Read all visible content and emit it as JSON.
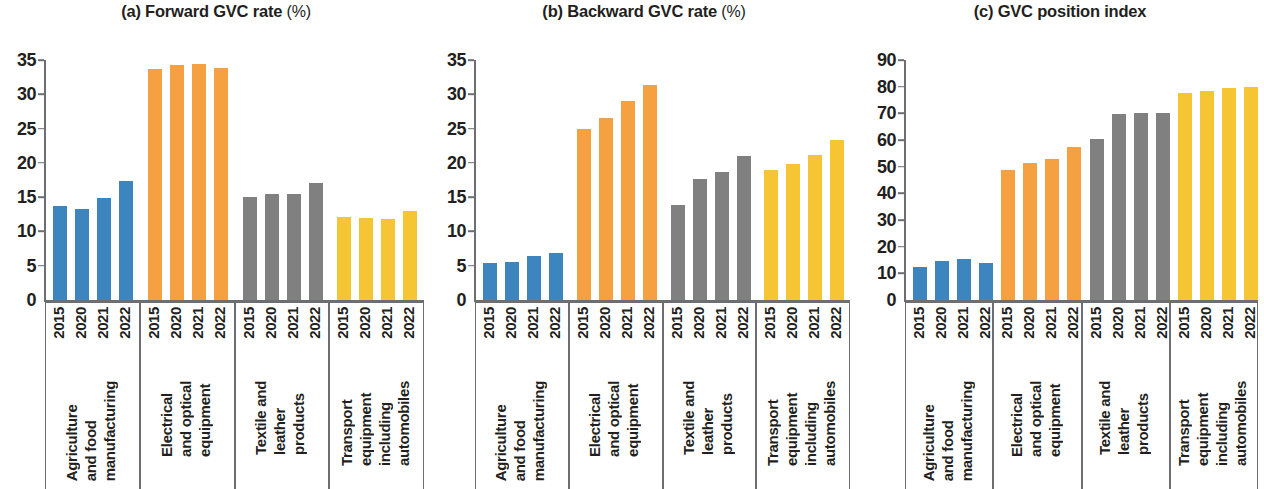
{
  "chart_data": [
    {
      "type": "bar",
      "panel": "(a)",
      "title": "(a) Forward GVC rate",
      "title_main": "(a) Forward GVC rate",
      "title_unit": "(%)",
      "xlabel": "",
      "ylabel": "",
      "ylim": [
        0,
        35
      ],
      "yticks": [
        0,
        5,
        10,
        15,
        20,
        25,
        30,
        35
      ],
      "grid": false,
      "legend": "none",
      "categories": [
        "Agriculture and food manufacturing",
        "Electrical and optical equipment",
        "Textile and leather products",
        "Transport equipment including automobiles"
      ],
      "x": [
        "2015",
        "2020",
        "2021",
        "2022"
      ],
      "series": [
        {
          "name": "Agriculture and food manufacturing",
          "color": "#3d85bf",
          "values": [
            13.7,
            13.3,
            14.9,
            17.3
          ]
        },
        {
          "name": "Electrical and optical equipment",
          "color": "#f5a142",
          "values": [
            33.7,
            34.3,
            34.4,
            33.8
          ]
        },
        {
          "name": "Textile and leather products",
          "color": "#808080",
          "values": [
            15.0,
            15.4,
            15.4,
            17.1
          ]
        },
        {
          "name": "Transport equipment including automobiles",
          "color": "#f6c533",
          "values": [
            12.1,
            11.9,
            11.8,
            13.0
          ]
        }
      ]
    },
    {
      "type": "bar",
      "panel": "(b)",
      "title": "(b) Backward GVC rate",
      "title_main": "(b) Backward GVC rate",
      "title_unit": "(%)",
      "xlabel": "",
      "ylabel": "",
      "ylim": [
        0,
        35
      ],
      "yticks": [
        0,
        5,
        10,
        15,
        20,
        25,
        30,
        35
      ],
      "grid": false,
      "legend": "none",
      "categories": [
        "Agriculture and food manufacturing",
        "Electrical and optical equipment",
        "Textile and leather products",
        "Transport equipment including automobiles"
      ],
      "x": [
        "2015",
        "2020",
        "2021",
        "2022"
      ],
      "series": [
        {
          "name": "Agriculture and food manufacturing",
          "color": "#3d85bf",
          "values": [
            5.4,
            5.5,
            6.4,
            6.8
          ]
        },
        {
          "name": "Electrical and optical equipment",
          "color": "#f5a142",
          "values": [
            25.0,
            26.6,
            29.0,
            31.4
          ]
        },
        {
          "name": "Textile and leather products",
          "color": "#808080",
          "values": [
            13.8,
            17.7,
            18.6,
            21.0
          ]
        },
        {
          "name": "Transport equipment including automobiles",
          "color": "#f6c533",
          "values": [
            18.9,
            19.8,
            21.2,
            23.3
          ]
        }
      ]
    },
    {
      "type": "bar",
      "panel": "(c)",
      "title": "(c) GVC position index",
      "title_main": "(c) GVC position index",
      "title_unit": "",
      "xlabel": "",
      "ylabel": "",
      "ylim": [
        0,
        90
      ],
      "yticks": [
        0,
        10,
        20,
        30,
        40,
        50,
        60,
        70,
        80,
        90
      ],
      "grid": false,
      "legend": "none",
      "categories": [
        "Agriculture and food manufacturing",
        "Electrical and optical equipment",
        "Textile and leather products",
        "Transport equipment including automobiles"
      ],
      "x": [
        "2015",
        "2020",
        "2021",
        "2022"
      ],
      "series": [
        {
          "name": "Agriculture and food manufacturing",
          "color": "#3d85bf",
          "values": [
            12.4,
            14.8,
            15.2,
            13.8
          ]
        },
        {
          "name": "Electrical and optical equipment",
          "color": "#f5a142",
          "values": [
            48.8,
            51.3,
            52.9,
            57.5
          ]
        },
        {
          "name": "Textile and leather products",
          "color": "#808080",
          "values": [
            60.5,
            69.8,
            70.2,
            70.3
          ]
        },
        {
          "name": "Transport equipment including automobiles",
          "color": "#f6c533",
          "values": [
            77.5,
            78.3,
            79.6,
            79.8
          ]
        }
      ]
    }
  ],
  "category_label_lines": [
    [
      "Agriculture",
      "and food",
      "manufacturing"
    ],
    [
      "Electrical",
      "and optical",
      "equipment"
    ],
    [
      "Textile and",
      "leather",
      "products"
    ],
    [
      "Transport",
      "equipment",
      "including",
      "automobiles"
    ]
  ],
  "colors": {
    "blue": "#3d85bf",
    "orange": "#f5a142",
    "gray": "#808080",
    "yellow": "#f6c533",
    "axis": "#6d6e71",
    "text": "#231f20",
    "background": "#ffffff"
  }
}
